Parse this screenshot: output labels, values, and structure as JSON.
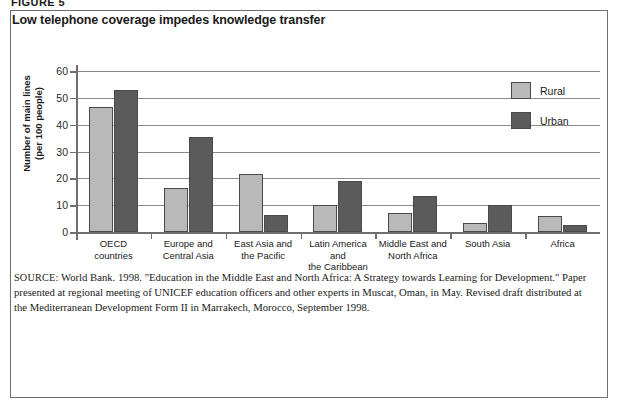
{
  "figure": {
    "label": "FIGURE 5",
    "title": "Low telephone coverage impedes knowledge transfer"
  },
  "chart_data": {
    "type": "bar",
    "title": "Low telephone coverage impedes knowledge transfer",
    "xlabel": "",
    "ylabel": "Number of main lines (per 100 people)",
    "ylabel_line1": "Number of main lines",
    "ylabel_line2": "(per 100 people)",
    "ylim": [
      0,
      60
    ],
    "ytick_step": 10,
    "yticks": [
      60,
      50,
      40,
      30,
      20,
      10,
      0
    ],
    "grid": true,
    "legend_position": "top-right",
    "categories": [
      "OECD countries",
      "Europe and Central Asia",
      "East Asia and the Pacific",
      "Latin America and the Caribbean",
      "Middle East and North Africa",
      "South Asia",
      "Africa"
    ],
    "category_lines": [
      [
        "OECD",
        "countries"
      ],
      [
        "Europe and",
        "Central Asia"
      ],
      [
        "East Asia and",
        "the Pacific"
      ],
      [
        "Latin America and",
        "the Caribbean"
      ],
      [
        "Middle East and",
        "North Africa"
      ],
      [
        "South Asia",
        ""
      ],
      [
        "Africa",
        ""
      ]
    ],
    "series": [
      {
        "name": "Rural",
        "color": "#b9b9b9",
        "values": [
          46.5,
          16.5,
          21.5,
          10.0,
          7.0,
          3.5,
          6.0
        ]
      },
      {
        "name": "Urban",
        "color": "#5b5b5b",
        "values": [
          53.0,
          35.5,
          6.5,
          19.0,
          13.5,
          10.0,
          2.5
        ]
      }
    ]
  },
  "legend": {
    "items": [
      {
        "label": "Rural"
      },
      {
        "label": "Urban"
      }
    ]
  },
  "source": {
    "tag": "SOURCE:",
    "text": " World Bank. 1998. \"Education in the Middle East and North Africa: A Strategy towards Learning for Development.\" Paper presented at regional meeting of UNICEF education officers and other experts in Muscat, Oman, in May. Revised draft distributed at the Mediterranean Development Form II in Marrakech, Morocco, September 1998."
  }
}
